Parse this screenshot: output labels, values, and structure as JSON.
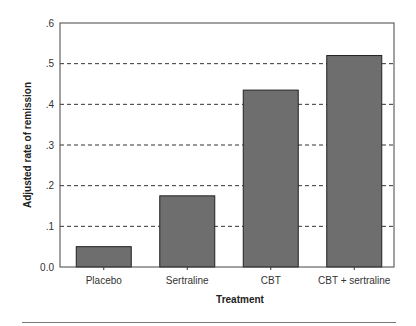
{
  "chart_data": {
    "type": "bar",
    "title": "",
    "xlabel": "Treatment",
    "ylabel": "Adjusted rate of remission",
    "categories": [
      "Placebo",
      "Sertraline",
      "CBT",
      "CBT + sertraline"
    ],
    "values": [
      0.05,
      0.175,
      0.435,
      0.52
    ],
    "ylim": [
      0,
      0.6
    ],
    "yticks": [
      0.0,
      0.1,
      0.2,
      0.3,
      0.4,
      0.5,
      0.6
    ],
    "ytick_labels": [
      "0.0",
      ".1",
      ".2",
      ".3",
      ".4",
      ".5",
      ".6"
    ],
    "grid": "horizontal dashed",
    "legend": "none",
    "bar_color": "#6e6e6e"
  }
}
